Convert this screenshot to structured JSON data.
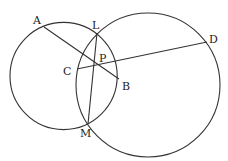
{
  "diagram": {
    "type": "geometry",
    "colors": {
      "stroke": "#333333",
      "label": "#222222",
      "background": "#ffffff"
    },
    "circles": [
      {
        "name": "left-circle",
        "cx": 63.6,
        "cy": 76,
        "r": 53.6
      },
      {
        "name": "right-circle",
        "cx": 148,
        "cy": 85,
        "r": 72
      }
    ],
    "points": {
      "A": {
        "x": 44,
        "y": 27,
        "label": "A",
        "lx": 33,
        "ly": 24
      },
      "L": {
        "x": 97,
        "y": 33,
        "label": "L",
        "lx": 92,
        "ly": 29
      },
      "P": {
        "x": 94.7,
        "y": 64,
        "label": "P",
        "lx": 99,
        "ly": 62
      },
      "C": {
        "x": 77,
        "y": 69,
        "label": "C",
        "lx": 63,
        "ly": 75
      },
      "B": {
        "x": 119,
        "y": 79,
        "label": "B",
        "lx": 122,
        "ly": 90
      },
      "D": {
        "x": 207,
        "y": 42,
        "label": "D",
        "lx": 209,
        "ly": 43
      },
      "M": {
        "x": 88,
        "y": 124,
        "label": "M",
        "lx": 80,
        "ly": 137
      }
    },
    "segments": [
      {
        "name": "segment-AB",
        "from": "A",
        "to": "B"
      },
      {
        "name": "segment-CD",
        "from": "C",
        "to": "D"
      },
      {
        "name": "segment-LM",
        "from": "L",
        "to": "M"
      }
    ]
  }
}
